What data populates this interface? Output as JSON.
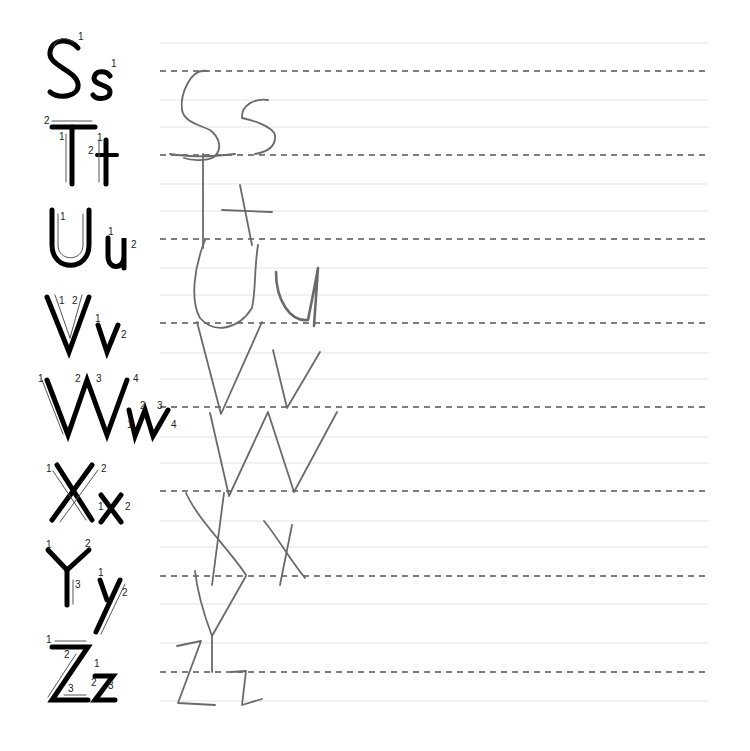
{
  "worksheet": {
    "type": "handwriting-practice",
    "letters_range": "S-Z",
    "rule_lines": {
      "x_start": 160,
      "x_end": 708,
      "solid_color": "#e4e4e4",
      "dashed_color": "#555555",
      "solid_y": [
        43,
        100,
        127,
        184,
        211,
        268,
        295,
        353,
        379,
        437,
        463,
        521,
        547,
        604,
        643,
        701
      ],
      "dashed_y": [
        71,
        155,
        239,
        323,
        407,
        491,
        576,
        672
      ]
    },
    "models": [
      {
        "upper": "S",
        "lower": "s",
        "y": 98,
        "stroke_numbers": [
          "1",
          "1"
        ]
      },
      {
        "upper": "T",
        "lower": "t",
        "y": 182,
        "stroke_numbers": [
          "2",
          "1",
          "1",
          "2"
        ]
      },
      {
        "upper": "U",
        "lower": "u",
        "y": 266,
        "stroke_numbers": [
          "1",
          "1",
          "2"
        ]
      },
      {
        "upper": "V",
        "lower": "v",
        "y": 352,
        "stroke_numbers": [
          "1",
          "2",
          "1",
          "2"
        ]
      },
      {
        "upper": "W",
        "lower": "w",
        "y": 434,
        "stroke_numbers": [
          "1",
          "2",
          "3",
          "4",
          "1",
          "2",
          "3",
          "4"
        ]
      },
      {
        "upper": "X",
        "lower": "x",
        "y": 519,
        "stroke_numbers": [
          "1",
          "2",
          "1",
          "2"
        ]
      },
      {
        "upper": "Y",
        "lower": "y",
        "y": 603,
        "stroke_numbers": [
          "1",
          "2",
          "3",
          "1",
          "2"
        ]
      },
      {
        "upper": "Z",
        "lower": "z",
        "y": 700,
        "stroke_numbers": [
          "1",
          "2",
          "3",
          "1",
          "2",
          "3"
        ]
      }
    ],
    "handwriting": {
      "color": "#6a6a6a",
      "letters": [
        "S",
        "s",
        "T",
        "t",
        "U",
        "u",
        "V",
        "v",
        "W",
        "w",
        "X",
        "x",
        "Y",
        "y",
        "Z",
        "z"
      ]
    }
  }
}
